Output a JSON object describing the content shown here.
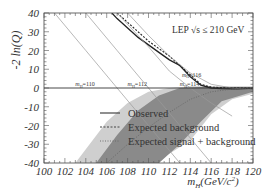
{
  "chart_data": {
    "type": "line",
    "title": "LEP √s ≤ 210 GeV",
    "xlabel": "m_H(GeV/c^2)",
    "ylabel": "-2 ln(Q)",
    "xlim": [
      100,
      120
    ],
    "ylim": [
      -40,
      40
    ],
    "x_ticks": [
      100,
      102,
      104,
      106,
      108,
      110,
      112,
      114,
      116,
      118,
      120
    ],
    "y_ticks": [
      40,
      30,
      20,
      10,
      0,
      -10,
      -20,
      -30,
      -40
    ],
    "legend": {
      "placement": "center-right",
      "entries": [
        {
          "label": "Observed",
          "style": "solid"
        },
        {
          "label": "Expected background",
          "style": "dashed"
        },
        {
          "label": "Expected signal + background",
          "style": "dotted"
        }
      ]
    },
    "annotations": [
      {
        "text": "m_H=110",
        "x": 103,
        "y": 0
      },
      {
        "text": "m_H=112",
        "x": 108,
        "y": 0
      },
      {
        "text": "m_H=114",
        "x": 113,
        "y": 0
      },
      {
        "text": "m_H=116",
        "x": 113.2,
        "y": 5
      }
    ],
    "series": [
      {
        "name": "Observed",
        "x": [
          106.5,
          107,
          108,
          109,
          110,
          111,
          112,
          113,
          114,
          115,
          116,
          117,
          118,
          119,
          120
        ],
        "y": [
          40,
          37,
          32,
          27,
          23,
          19,
          15,
          12,
          6,
          1.5,
          0,
          -0.3,
          -0.5,
          -0.5,
          -0.5
        ]
      },
      {
        "name": "Expected background",
        "x": [
          107,
          108,
          109,
          110,
          111,
          112,
          113,
          114,
          115,
          116,
          117,
          118,
          119,
          120
        ],
        "y": [
          40,
          35,
          30,
          25,
          21,
          17,
          12,
          7,
          2,
          0.5,
          0.2,
          0.1,
          0,
          0
        ]
      },
      {
        "name": "Expected signal + background",
        "x": [
          102,
          104,
          106,
          108,
          110,
          112,
          114,
          115,
          116,
          118,
          120
        ],
        "y": [
          -60,
          -50,
          -40,
          -30,
          -21,
          -13,
          -6,
          -4,
          -2,
          -0.6,
          -0.2
        ]
      },
      {
        "name": "test mass m_H=110",
        "x": [
          101,
          104,
          107,
          110,
          113
        ],
        "y": [
          40,
          20,
          0,
          -20,
          -40
        ]
      },
      {
        "name": "test mass m_H=112",
        "x": [
          104,
          107,
          110,
          113,
          116
        ],
        "y": [
          40,
          20,
          0,
          -20,
          -40
        ]
      },
      {
        "name": "test mass m_H=114",
        "x": [
          107,
          110,
          112,
          114,
          116,
          118
        ],
        "y": [
          40,
          22,
          9,
          0,
          -8,
          -15
        ]
      },
      {
        "name": "test mass m_H=116",
        "x": [
          108,
          110,
          112,
          114,
          116,
          118,
          120
        ],
        "y": [
          40,
          28,
          17,
          8,
          2,
          0,
          -1
        ]
      }
    ],
    "bands": [
      {
        "name": "background 2-sigma",
        "color": "#cfcfcf",
        "x": [
          103,
          106,
          108,
          110,
          112,
          114,
          116,
          118,
          120
        ],
        "upper": [
          -40,
          -18,
          -8,
          -2,
          0,
          1,
          1,
          1,
          1
        ],
        "lower": [
          -40,
          -40,
          -40,
          -40,
          -35,
          -28,
          -14,
          -6,
          -3
        ]
      },
      {
        "name": "background 1-sigma",
        "color": "#8a8a8a",
        "x": [
          105,
          107,
          109,
          111,
          113,
          115,
          117,
          120
        ],
        "upper": [
          -40,
          -25,
          -12,
          -4,
          0,
          0.5,
          0.5,
          0.5
        ],
        "lower": [
          -40,
          -40,
          -40,
          -40,
          -30,
          -18,
          -7,
          -2
        ]
      }
    ]
  }
}
